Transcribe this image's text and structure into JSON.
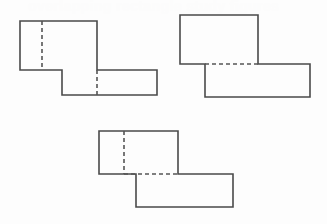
{
  "page": {
    "background_color": "#fdfdfd",
    "width": 327,
    "height": 224
  },
  "ghost_text": {
    "top_line": "overlapping rectangle study figures",
    "secondary_line": "hidden edge"
  },
  "style": {
    "solid_stroke_color": "#4a4a4a",
    "dashed_stroke_color": "#555555",
    "solid_stroke_width": 1.6,
    "dashed_stroke_width": 1.6,
    "dash_pattern": "4 3"
  },
  "figures": [
    {
      "id": "figure-1",
      "label": "Figure 1",
      "position": "top-left",
      "upper_rect": {
        "x": 20,
        "y": 21,
        "w": 77,
        "h": 49
      },
      "lower_rect": {
        "x": 62,
        "y": 70,
        "w": 95,
        "h": 25
      },
      "outline_points": "20,21 97,21 97,70 157,70 157,95 62,95 62,70 20,70",
      "dashed_segments": [
        {
          "name": "vertical-left-dash",
          "x1": 42,
          "y1": 21,
          "x2": 42,
          "y2": 70
        },
        {
          "name": "vertical-right-dash",
          "x1": 97,
          "y1": 70,
          "x2": 97,
          "y2": 95
        }
      ]
    },
    {
      "id": "figure-2",
      "label": "Figure 2",
      "position": "top-right",
      "upper_rect": {
        "x": 180,
        "y": 15,
        "w": 78,
        "h": 49
      },
      "lower_rect": {
        "x": 205,
        "y": 64,
        "w": 105,
        "h": 33
      },
      "outline_points": "180,15 258,15 258,64 310,64 310,97 205,97 205,64 180,64",
      "dashed_segments": [
        {
          "name": "horizontal-dash",
          "x1": 205,
          "y1": 64,
          "x2": 258,
          "y2": 64
        }
      ]
    },
    {
      "id": "figure-3",
      "label": "Figure 3",
      "position": "bottom-center",
      "upper_rect": {
        "x": 99,
        "y": 131,
        "w": 79,
        "h": 43
      },
      "lower_rect": {
        "x": 136,
        "y": 174,
        "w": 97,
        "h": 33
      },
      "outline_points": "99,131 178,131 178,174 233,174 233,207 136,207 136,174 99,174",
      "dashed_segments": [
        {
          "name": "vertical-dash",
          "x1": 124,
          "y1": 131,
          "x2": 124,
          "y2": 174
        },
        {
          "name": "horizontal-dash",
          "x1": 124,
          "y1": 174,
          "x2": 178,
          "y2": 174
        }
      ]
    }
  ]
}
